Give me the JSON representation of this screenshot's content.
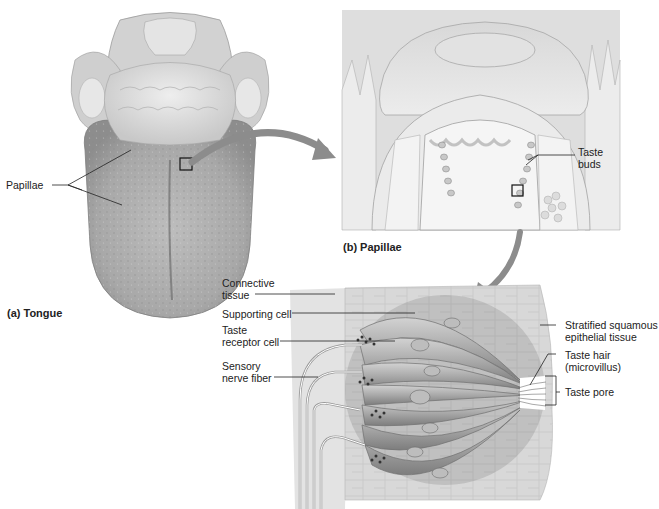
{
  "figure": {
    "panels": [
      {
        "id": "a",
        "caption": "(a) Tongue"
      },
      {
        "id": "b",
        "caption": "(b) Papillae"
      },
      {
        "id": "c",
        "caption": ""
      }
    ],
    "labels": {
      "papillae": "Papillae",
      "taste_buds_line1": "Taste",
      "taste_buds_line2": "buds",
      "connective_tissue_line1": "Connective",
      "connective_tissue_line2": "tissue",
      "supporting_cell": "Supporting cell",
      "taste_receptor_line1": "Taste",
      "taste_receptor_line2": "receptor cell",
      "sensory_nerve_line1": "Sensory",
      "sensory_nerve_line2": "nerve fiber",
      "stratified_line1": "Stratified squamous",
      "stratified_line2": "epithelial tissue",
      "taste_hair_line1": "Taste hair",
      "taste_hair_line2": "(microvillus)",
      "taste_pore": "Taste pore"
    },
    "colors": {
      "background": "#ffffff",
      "tissue_light": "#e6e6e6",
      "tissue_mid": "#c4c4c4",
      "tissue_dark": "#8a8a8a",
      "arrow": "#8c8c8c",
      "leader_line": "#222222"
    }
  }
}
